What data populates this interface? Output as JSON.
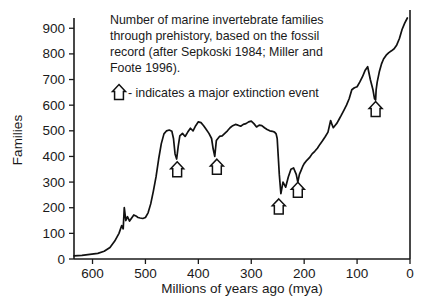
{
  "chart_data": {
    "type": "line",
    "title": "Number of marine invertebrate families through prehistory, based on the fossil record (after Sepkoski 1984; Miller and Foote 1996).",
    "title_lines": [
      "Number of marine invertebrate families",
      "through prehistory, based on the fossil",
      "record (after Sepkoski 1984; Miller and",
      "Foote 1996)."
    ],
    "legend": {
      "symbol": "up-arrow-outline",
      "text": "- indicates a major extinction event",
      "position": "inside-top-left"
    },
    "xlabel": "Millions of years ago (mya)",
    "ylabel": "Families",
    "xlim": [
      635,
      0
    ],
    "ylim": [
      0,
      940
    ],
    "x_reversed": true,
    "grid": false,
    "xticks": [
      600,
      500,
      400,
      300,
      200,
      100,
      0
    ],
    "xtick_labels": [
      "600",
      "500",
      "400",
      "300",
      "200",
      "100",
      "0"
    ],
    "yticks": [
      0,
      100,
      200,
      300,
      400,
      500,
      600,
      700,
      800,
      900
    ],
    "ytick_labels": [
      "0",
      "100",
      "200",
      "300",
      "400",
      "500",
      "600",
      "700",
      "800",
      "900"
    ],
    "series_name": "Marine invertebrate families",
    "x": [
      635,
      620,
      605,
      590,
      578,
      567,
      558,
      550,
      545,
      542,
      540,
      537,
      534,
      530,
      526,
      522,
      518,
      514,
      510,
      505,
      500,
      495,
      490,
      485,
      480,
      475,
      470,
      465,
      460,
      455,
      450,
      447,
      444,
      441,
      438,
      435,
      430,
      425,
      420,
      415,
      410,
      405,
      400,
      395,
      390,
      385,
      380,
      375,
      372,
      369,
      366,
      363,
      360,
      355,
      350,
      345,
      340,
      335,
      330,
      325,
      320,
      315,
      310,
      305,
      300,
      295,
      290,
      285,
      280,
      275,
      270,
      265,
      260,
      256,
      253,
      251,
      249,
      247,
      244,
      240,
      235,
      230,
      225,
      220,
      215,
      212,
      209,
      206,
      203,
      200,
      195,
      190,
      185,
      180,
      175,
      170,
      165,
      160,
      155,
      150,
      148,
      145,
      142,
      138,
      134,
      130,
      125,
      120,
      115,
      110,
      105,
      100,
      95,
      90,
      85,
      80,
      75,
      70,
      67,
      65,
      64,
      62,
      58,
      54,
      50,
      45,
      40,
      35,
      30,
      25,
      20,
      15,
      10,
      5,
      2,
      0
    ],
    "y": [
      12,
      14,
      18,
      22,
      30,
      45,
      70,
      100,
      130,
      118,
      200,
      150,
      165,
      148,
      160,
      172,
      168,
      162,
      160,
      158,
      162,
      180,
      215,
      265,
      320,
      390,
      450,
      488,
      500,
      503,
      498,
      470,
      410,
      390,
      440,
      480,
      490,
      478,
      495,
      510,
      500,
      520,
      535,
      532,
      520,
      505,
      490,
      470,
      430,
      400,
      462,
      470,
      478,
      480,
      490,
      500,
      512,
      520,
      525,
      522,
      518,
      525,
      528,
      535,
      538,
      528,
      515,
      522,
      520,
      512,
      505,
      500,
      498,
      495,
      488,
      470,
      400,
      330,
      255,
      300,
      280,
      320,
      350,
      355,
      330,
      300,
      330,
      345,
      360,
      372,
      385,
      395,
      410,
      420,
      432,
      448,
      462,
      478,
      495,
      540,
      528,
      512,
      520,
      530,
      545,
      560,
      580,
      600,
      625,
      660,
      668,
      672,
      690,
      710,
      735,
      750,
      700,
      660,
      625,
      620,
      660,
      690,
      730,
      760,
      780,
      795,
      805,
      812,
      820,
      835,
      860,
      895,
      920,
      940
    ],
    "annotations": [
      {
        "name": "ordovician-extinction",
        "label": "major extinction event",
        "x_mya": 440,
        "y_families": 350,
        "symbol": "up-arrow-outline"
      },
      {
        "name": "devonian-extinction",
        "label": "major extinction event",
        "x_mya": 365,
        "y_families": 360,
        "symbol": "up-arrow-outline"
      },
      {
        "name": "permian-extinction",
        "label": "major extinction event",
        "x_mya": 248,
        "y_families": 205,
        "symbol": "up-arrow-outline"
      },
      {
        "name": "triassic-extinction",
        "label": "major extinction event",
        "x_mya": 212,
        "y_families": 270,
        "symbol": "up-arrow-outline"
      },
      {
        "name": "cretaceous-extinction",
        "label": "major extinction event",
        "x_mya": 65,
        "y_families": 585,
        "symbol": "up-arrow-outline"
      }
    ],
    "colors": {
      "line": "#111111",
      "axis": "#1a1a1a",
      "text": "#1a1a1a",
      "background": "#ffffff"
    }
  }
}
